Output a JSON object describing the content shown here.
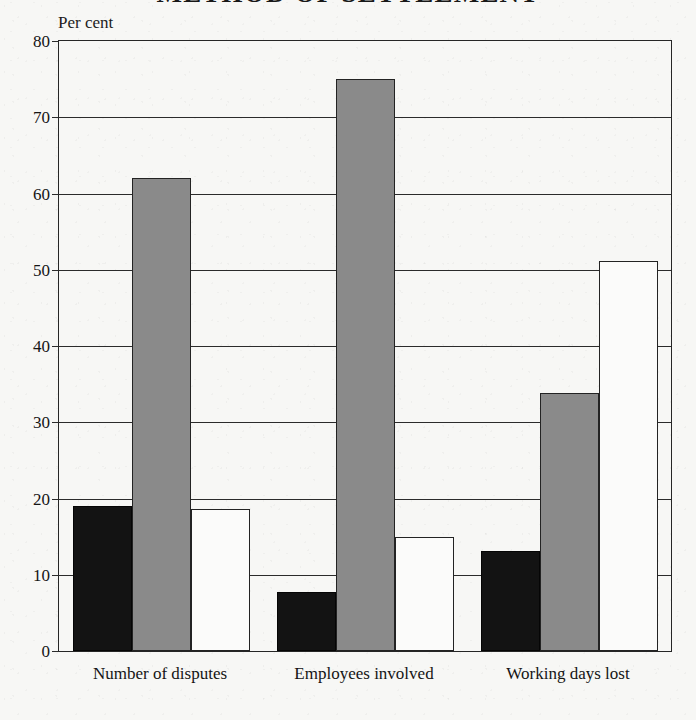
{
  "chart_data": {
    "type": "bar",
    "title": "METHOD OF SETTLEMENT",
    "ylabel": "Per cent",
    "xlabel": "",
    "ylim": [
      0,
      80
    ],
    "yticks": [
      0,
      10,
      20,
      30,
      40,
      50,
      60,
      70,
      80
    ],
    "ytick_labels": [
      "0",
      "10",
      "20",
      "30",
      "40",
      "50",
      "60",
      "70",
      "80"
    ],
    "grid": true,
    "legend": "none",
    "categories": [
      "Number of disputes",
      "Employees involved",
      "Working days lost"
    ],
    "series": [
      {
        "name": "black",
        "color": "#131313",
        "values": [
          19.0,
          7.7,
          13.1
        ]
      },
      {
        "name": "grey",
        "color": "#8a8a8a",
        "values": [
          62.0,
          75.0,
          33.9
        ]
      },
      {
        "name": "white",
        "color": "#fbfbfa",
        "values": [
          18.6,
          15.0,
          51.2
        ]
      }
    ]
  },
  "axis": {
    "unit_caption": "Per cent"
  }
}
